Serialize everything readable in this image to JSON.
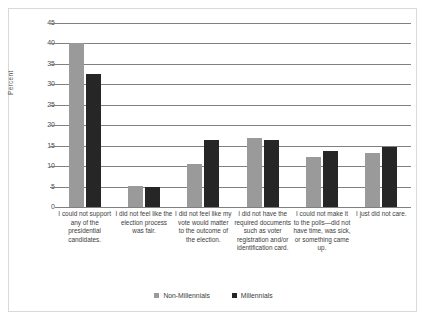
{
  "chart_data": {
    "type": "bar",
    "title": "",
    "subtitle": "",
    "xlabel": "",
    "ylabel": "Percent",
    "ylim": [
      0,
      45
    ],
    "ytick_values": [
      0,
      5,
      10,
      15,
      20,
      25,
      30,
      35,
      40,
      45
    ],
    "ytick_labels": [
      "0",
      "5",
      "10",
      "15",
      "20",
      "25",
      "30",
      "35",
      "40",
      "45"
    ],
    "grid": true,
    "legend_position": "bottom",
    "categories": [
      "I could not support any of the presidential candidates.",
      "I did not feel like the election process was fair.",
      "I did not feel like my vote would matter to the outcome of the election.",
      "I did not have the required documents such as voter registration and/or identification card.",
      "I could not make it to the polls—did not have time, was sick, or something came up.",
      "I just did not care."
    ],
    "series": [
      {
        "name": "Non-Millennials",
        "color": "#9a9a9a",
        "values": [
          40.0,
          5.2,
          10.6,
          17.0,
          12.3,
          13.2
        ]
      },
      {
        "name": "Millennials",
        "color": "#262626",
        "values": [
          32.5,
          4.9,
          16.4,
          16.3,
          13.6,
          14.8
        ]
      }
    ]
  },
  "colors": {
    "non_millennials": "#9a9a9a",
    "millennials": "#262626",
    "gridline": "#808080",
    "frame_border": "#d9d9d9",
    "text": "#3d3d3d",
    "background": "#ffffff"
  }
}
